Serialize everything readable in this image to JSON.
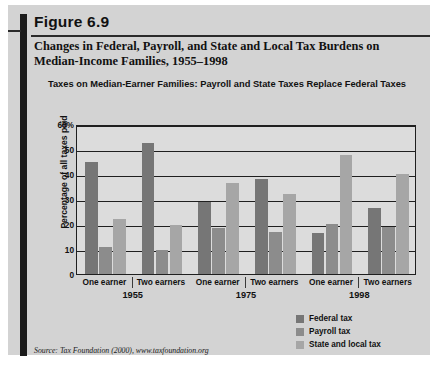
{
  "figure": {
    "label": "Figure 6.9",
    "title": "Changes in Federal, Payroll, and State and Local Tax Burdens on Median-Income Families, 1955–1998",
    "subtitle": "Taxes on Median-Earner Families: Payroll and State Taxes Replace Federal Taxes",
    "source": "Source: Tax Foundation (2000), www.taxfoundation.org"
  },
  "colors": {
    "card_background": "#d3d3d3",
    "plot_background": "#dcdcdc",
    "axis": "#1f1f1f",
    "federal_tax": "#767676",
    "payroll_tax": "#8c8c8c",
    "state_and_local_tax": "#a6a6a6"
  },
  "chart_data": {
    "type": "bar",
    "title": "Taxes on Median-Earner Families: Payroll and State Taxes Replace Federal Taxes",
    "xlabel": "",
    "ylabel": "Percentage of all taxes paid",
    "ylim": [
      0,
      60
    ],
    "yticks": [
      "0",
      "10",
      "20",
      "30",
      "40",
      "50",
      "60%"
    ],
    "ytick_values": [
      0,
      10,
      20,
      30,
      40,
      50,
      60
    ],
    "grid": true,
    "legend_position": "bottom-right",
    "categories": [
      "One earner",
      "Two earners",
      "One earner",
      "Two earners",
      "One earner",
      "Two earners"
    ],
    "groups": [
      {
        "year": "1955",
        "categories": [
          "One earner",
          "Two earners"
        ]
      },
      {
        "year": "1975",
        "categories": [
          "One earner",
          "Two earners"
        ]
      },
      {
        "year": "1998",
        "categories": [
          "One earner",
          "Two earners"
        ]
      }
    ],
    "series": [
      {
        "name": "Federal tax",
        "color": "#767676",
        "values": [
          45,
          52.5,
          29,
          38,
          16.5,
          26.5
        ]
      },
      {
        "name": "Payroll tax",
        "color": "#8c8c8c",
        "values": [
          11,
          9.5,
          18.5,
          17,
          20,
          19
        ]
      },
      {
        "name": "State and local tax",
        "color": "#a6a6a6",
        "values": [
          22,
          19.5,
          36.5,
          32,
          47.5,
          40
        ]
      }
    ]
  },
  "legend": {
    "items": [
      {
        "label": "Federal tax",
        "color": "#767676"
      },
      {
        "label": "Payroll tax",
        "color": "#8c8c8c"
      },
      {
        "label": "State and local tax",
        "color": "#a6a6a6"
      }
    ]
  }
}
